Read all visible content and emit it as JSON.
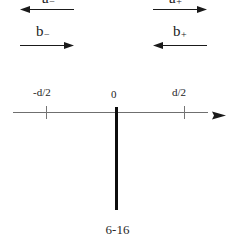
{
  "figure": {
    "caption": "6-16",
    "colors": {
      "axis": "#6f6f6f",
      "tick": "#757575",
      "barrier": "#0d0d0d",
      "text": "#1c1c1c",
      "background": "#ffffff",
      "arrow": "#1a1a1a"
    }
  },
  "amplitudes": [
    {
      "id": "a-minus",
      "base": "a",
      "subscript": "−",
      "label": "a₋",
      "direction": "left",
      "side": "left",
      "row": "top"
    },
    {
      "id": "a-plus",
      "base": "a",
      "subscript": "+",
      "label": "a₊",
      "direction": "right",
      "side": "right",
      "row": "top"
    },
    {
      "id": "b-minus",
      "base": "b",
      "subscript": "−",
      "label": "b₋",
      "direction": "right",
      "side": "left",
      "row": "bottom"
    },
    {
      "id": "b-plus",
      "base": "b",
      "subscript": "+",
      "label": "b₊",
      "direction": "left",
      "side": "right",
      "row": "bottom"
    }
  ],
  "axis": {
    "arrow_direction": "right",
    "ticks": [
      {
        "id": "tick-minus-d-over-2",
        "label": "-d/2",
        "value": "-d/2"
      },
      {
        "id": "tick-zero",
        "label": "0",
        "value": "0"
      },
      {
        "id": "tick-d-over-2",
        "label": "d/2",
        "value": "d/2"
      }
    ]
  },
  "barrier": {
    "id": "barrier-at-origin",
    "position": "0"
  }
}
